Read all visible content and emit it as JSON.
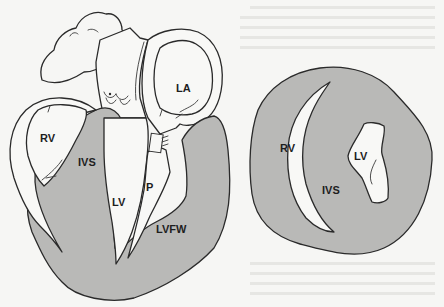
{
  "figure": {
    "type": "anatomical-diagram",
    "panels": [
      {
        "id": "long-axis",
        "description": "Long-axis (four-chamber style) section of the heart",
        "labels": {
          "rv": "RV",
          "ivs": "IVS",
          "lv": "LV",
          "p": "P",
          "la": "LA",
          "lvfw": "LVFW"
        }
      },
      {
        "id": "short-axis",
        "description": "Short-axis cross section of the ventricles",
        "labels": {
          "rv": "RV",
          "lv": "LV",
          "ivs": "IVS"
        }
      }
    ],
    "colors": {
      "background": "#f6f6f4",
      "muscle_fill": "#b9b9b7",
      "cavity_fill": "#f8f8f6",
      "outline": "#2a2a2a"
    }
  }
}
